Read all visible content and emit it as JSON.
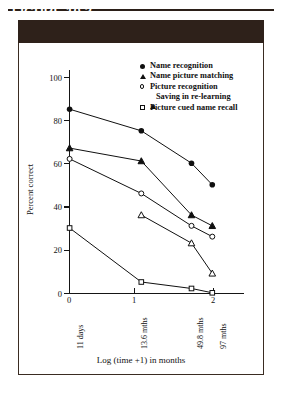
{
  "figure": {
    "header_label": "FIGURE 10.3"
  },
  "chart_data": {
    "type": "line",
    "title": "",
    "xlabel": "Log (time +1) in months",
    "ylabel": "Percent correct",
    "xlim": [
      0,
      2.2
    ],
    "ylim": [
      0,
      100
    ],
    "grid": false,
    "legend_position": "top-right",
    "x_tick_values": [
      0,
      1,
      2
    ],
    "x_tick_labels": [
      "0",
      "1",
      "2"
    ],
    "x_category_labels": [
      {
        "value": 0,
        "label": "11 days"
      },
      {
        "value": 1,
        "label": "13.6 mths"
      },
      {
        "value": 1.7,
        "label": "49.8 mths"
      },
      {
        "value": 1.99,
        "label": "97 mths"
      }
    ],
    "y_tick_values": [
      20,
      40,
      60,
      80,
      100
    ],
    "y_tick_labels": [
      "20",
      "40",
      "60",
      "80",
      "100"
    ],
    "x": [
      0,
      1,
      1.7,
      1.99
    ],
    "series": [
      {
        "name": "Name recognition",
        "marker": "filled-circle",
        "values": [
          85,
          75,
          60,
          50
        ]
      },
      {
        "name": "Name picture matching",
        "marker": "filled-triangle",
        "values": [
          67,
          61,
          36,
          31
        ]
      },
      {
        "name": "Picture recognition",
        "marker": "open-circle",
        "values": [
          62,
          46,
          31,
          26
        ]
      },
      {
        "name": "Saving in re-learning",
        "marker": "open-triangle",
        "values": [
          null,
          36,
          23,
          9
        ]
      },
      {
        "name": "Picture cued name recall",
        "marker": "open-square",
        "values": [
          30,
          5,
          2,
          0
        ]
      }
    ]
  },
  "colors": {
    "header_bg": "#2e211a",
    "header_text": "#ffffff",
    "frame_border": "#3a2c22",
    "ink": "#101010",
    "page_bg": "#ffffff"
  }
}
